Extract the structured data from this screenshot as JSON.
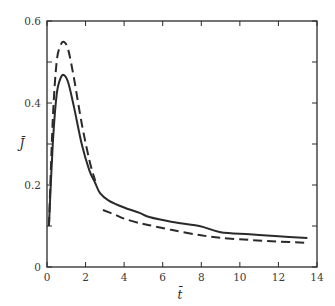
{
  "chart_data": {
    "type": "line",
    "title": "",
    "xlabel": "t̄",
    "ylabel": "J̄",
    "xlim": [
      0,
      14
    ],
    "ylim": [
      0,
      0.6
    ],
    "xticks": [
      0,
      2,
      4,
      6,
      8,
      10,
      12,
      14
    ],
    "xtick_labels": [
      "0",
      "2",
      "4",
      "6",
      "8",
      "10",
      "12",
      "14"
    ],
    "yticks": [
      0,
      0.1,
      0.2,
      0.3,
      0.4,
      0.5,
      0.6
    ],
    "ytick_labels": [
      "0",
      "",
      "0.2",
      "",
      "0.4",
      "",
      "0.6"
    ],
    "grid": false,
    "legend": null,
    "series": [
      {
        "name": "solid",
        "style": "solid",
        "color": "#2a2a2a",
        "segments": [
          {
            "x": [
              0.1,
              0.3,
              0.5,
              0.7,
              0.88,
              1.1,
              1.4,
              1.8,
              2.2,
              2.5,
              2.75,
              3.2,
              4.0,
              4.8,
              5.3,
              6.5,
              7.9,
              9.0,
              10.5,
              12.0,
              13.5
            ],
            "y": [
              0.1,
              0.3,
              0.42,
              0.46,
              0.468,
              0.45,
              0.39,
              0.3,
              0.235,
              0.205,
              0.18,
              0.162,
              0.145,
              0.132,
              0.122,
              0.11,
              0.1,
              0.085,
              0.08,
              0.075,
              0.071
            ]
          }
        ]
      },
      {
        "name": "dashed",
        "style": "dashed",
        "color": "#2a2a2a",
        "segments": [
          {
            "x": [
              0.1,
              0.3,
              0.5,
              0.7,
              0.88,
              1.1,
              1.4,
              1.8,
              2.2,
              2.5
            ],
            "y": [
              0.1,
              0.36,
              0.5,
              0.54,
              0.549,
              0.53,
              0.46,
              0.35,
              0.26,
              0.21
            ]
          },
          {
            "x": [
              2.9,
              3.5,
              4.0,
              4.8,
              5.3,
              6.5,
              7.9,
              9.0,
              10.5,
              12.0,
              13.5
            ],
            "y": [
              0.139,
              0.128,
              0.118,
              0.107,
              0.102,
              0.09,
              0.078,
              0.071,
              0.066,
              0.062,
              0.059
            ]
          }
        ]
      }
    ]
  },
  "plot_area": {
    "left": 47,
    "top": 21,
    "right": 317,
    "bottom": 267
  }
}
